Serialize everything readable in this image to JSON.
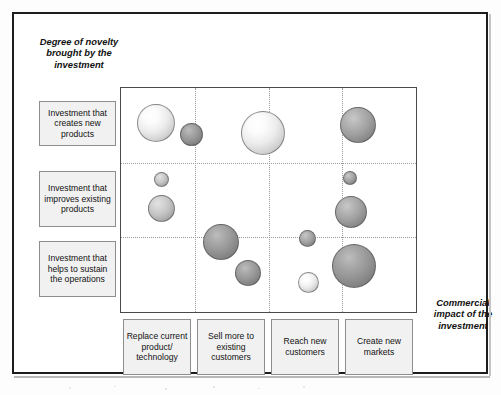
{
  "figure": {
    "y_axis_title": "Degree of novelty brought by the investment",
    "x_axis_title": "Commercial impact of the investment"
  },
  "row_categories": [
    {
      "label": "Investment that creates new products"
    },
    {
      "label": "Investment that improves existing products"
    },
    {
      "label": "Investment that helps to sustain the operations"
    }
  ],
  "col_categories": [
    {
      "label": "Replace current product/ technology"
    },
    {
      "label": "Sell more to existing customers"
    },
    {
      "label": "Reach new customers"
    },
    {
      "label": "Create new markets"
    }
  ],
  "chart_data": {
    "type": "scatter",
    "title": "",
    "subtitle": "",
    "xlabel": "Commercial impact of the investment",
    "ylabel": "Degree of novelty brought by the investment",
    "grid": true,
    "legend_position": "none",
    "x_categories": [
      "Replace current product/ technology",
      "Sell more to existing customers",
      "Reach new customers",
      "Create new markets"
    ],
    "y_categories": [
      "Investment that creates new products",
      "Investment that improves existing products",
      "Investment that helps to sustain the operations"
    ],
    "xlim": [
      0,
      4
    ],
    "ylim": [
      0,
      3
    ],
    "note": "Bubble area encodes relative investment size; x/y in category-grid units measured from the plot's lower-left corner.",
    "bubbles": [
      {
        "id": "b1",
        "x": 0.48,
        "y": 2.53,
        "size": 38,
        "tone": "light",
        "x_category": "Replace current product/ technology",
        "y_category": "Investment that creates new products"
      },
      {
        "id": "b2",
        "x": 0.96,
        "y": 2.38,
        "size": 23,
        "tone": "darker",
        "x_category": "Replace current product/ technology",
        "y_category": "Investment that creates new products"
      },
      {
        "id": "b3",
        "x": 1.93,
        "y": 2.4,
        "size": 44,
        "tone": "light",
        "x_category": "Sell more to existing customers",
        "y_category": "Investment that creates new products"
      },
      {
        "id": "b4",
        "x": 3.21,
        "y": 2.5,
        "size": 36,
        "tone": "dark",
        "x_category": "Create new markets",
        "y_category": "Investment that creates new products"
      },
      {
        "id": "b5",
        "x": 0.55,
        "y": 1.78,
        "size": 15,
        "tone": "mid",
        "x_category": "Replace current product/ technology",
        "y_category": "Investment that improves existing products"
      },
      {
        "id": "b6",
        "x": 0.55,
        "y": 1.39,
        "size": 27,
        "tone": "mid",
        "x_category": "Replace current product/ technology",
        "y_category": "Investment that improves existing products"
      },
      {
        "id": "b7",
        "x": 3.1,
        "y": 1.8,
        "size": 14,
        "tone": "dark",
        "x_category": "Create new markets",
        "y_category": "Investment that improves existing products"
      },
      {
        "id": "b8",
        "x": 3.12,
        "y": 1.34,
        "size": 32,
        "tone": "dark",
        "x_category": "Create new markets",
        "y_category": "Investment that improves existing products"
      },
      {
        "id": "b9",
        "x": 1.36,
        "y": 0.94,
        "size": 36,
        "tone": "darker",
        "x_category": "Sell more to existing customers",
        "y_category": "Investment that helps to sustain the operations"
      },
      {
        "id": "b10",
        "x": 1.72,
        "y": 0.52,
        "size": 26,
        "tone": "darker",
        "x_category": "Sell more to existing customers",
        "y_category": "Investment that helps to sustain the operations"
      },
      {
        "id": "b11",
        "x": 2.53,
        "y": 0.98,
        "size": 17,
        "tone": "dark",
        "x_category": "Reach new customers",
        "y_category": "Investment that helps to sustain the operations"
      },
      {
        "id": "b12",
        "x": 2.54,
        "y": 0.4,
        "size": 21,
        "tone": "light",
        "x_category": "Reach new customers",
        "y_category": "Investment that helps to sustain the operations"
      },
      {
        "id": "b13",
        "x": 3.16,
        "y": 0.62,
        "size": 44,
        "tone": "darker",
        "x_category": "Create new markets",
        "y_category": "Investment that helps to sustain the operations"
      }
    ],
    "vertical_gridlines": [
      1,
      2,
      3
    ],
    "horizontal_gridlines": [
      1,
      2
    ]
  }
}
